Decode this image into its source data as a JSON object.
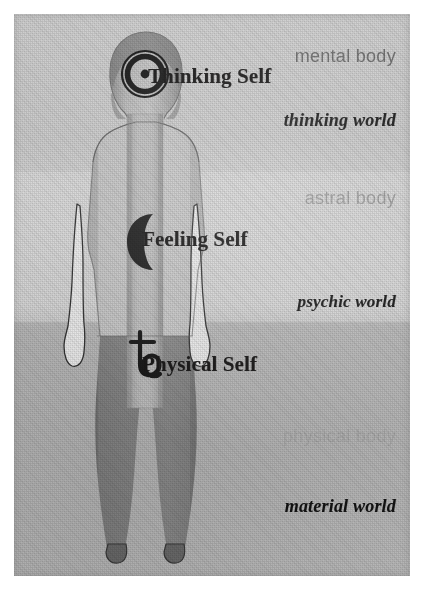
{
  "diagram": {
    "self_labels": [
      {
        "id": "thinking",
        "text": "Thinking Self",
        "symbol_name": "sun-symbol",
        "symbol_glyph": "☉"
      },
      {
        "id": "feeling",
        "text": "Feeling Self",
        "symbol_name": "moon-symbol",
        "symbol_glyph": "☽"
      },
      {
        "id": "physical",
        "text": "Physical Self",
        "symbol_name": "saturn-symbol",
        "symbol_glyph": "♄"
      }
    ],
    "body_labels": [
      {
        "id": "mental",
        "text": "mental body",
        "color": "#6a6a6a"
      },
      {
        "id": "astral",
        "text": "astral body",
        "color": "#9b9b9b"
      },
      {
        "id": "physical",
        "text": "physical body",
        "color": "#a8a8a8"
      }
    ],
    "world_labels": [
      {
        "id": "thinking",
        "text": "thinking world",
        "color": "#131313"
      },
      {
        "id": "psychic",
        "text": "psychic world",
        "color": "#131313"
      },
      {
        "id": "material",
        "text": "material world",
        "color": "#131313"
      }
    ],
    "bands": [
      {
        "id": "mental",
        "background": "#c6c6c6"
      },
      {
        "id": "astral",
        "background": "#cfcfcf"
      },
      {
        "id": "physical",
        "background": "#bdbdbd"
      }
    ],
    "figure": {
      "name": "human-figure-silhouette",
      "upper_body_fill": "#bcbcbc",
      "lower_body_fill": "#7f7f7f",
      "central_column_fill": "#b2b2b2",
      "arm_outline_color": "#3c3c3c",
      "arm_fill": "#e4e4e4"
    },
    "plate": {
      "background": "#c9c9c9",
      "page_background": "#ffffff"
    }
  }
}
